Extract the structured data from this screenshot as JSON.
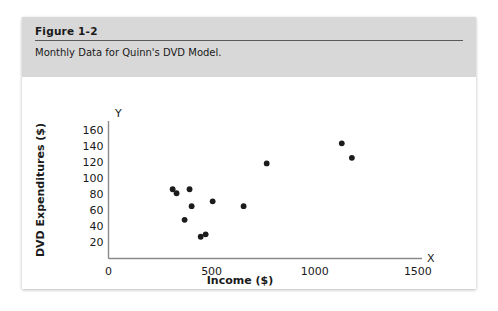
{
  "figure": {
    "number_label": "Figure 1-2",
    "caption": "Monthly Data for Quinn's DVD Model."
  },
  "colors": {
    "header_band": "#d8d8d8",
    "rule": "#5a5a5a",
    "axis": "#8a8a8a",
    "point": "#1c1c1c",
    "text": "#1a1a1a",
    "card_background": "#ffffff",
    "page_background": "#ffffff"
  },
  "chart_data": {
    "type": "scatter",
    "title": "Monthly Data for Quinn's DVD Model.",
    "xlabel": "Income ($)",
    "ylabel": "DVD Expenditures ($)",
    "x_axis_letter": "X",
    "y_axis_letter": "Y",
    "xlim": [
      0,
      1600
    ],
    "ylim": [
      0,
      172
    ],
    "xticks": [
      0,
      500,
      1000,
      1500
    ],
    "xticklabels": [
      "0",
      "500",
      "1000",
      "1500"
    ],
    "yticks": [
      20,
      40,
      60,
      80,
      100,
      120,
      140,
      160
    ],
    "yticklabels": [
      "20",
      "40",
      "60",
      "80",
      "100",
      "120",
      "140",
      "160"
    ],
    "grid": false,
    "legend": false,
    "marker": "filled-circle",
    "x": [
      311,
      330,
      393,
      369,
      403,
      447,
      471,
      505,
      655,
      767,
      1131,
      1180
    ],
    "y": [
      86,
      81,
      86,
      48,
      65,
      27,
      30,
      71,
      65,
      118,
      143,
      125
    ],
    "points": [
      {
        "x": 311,
        "y": 86
      },
      {
        "x": 330,
        "y": 81
      },
      {
        "x": 393,
        "y": 86
      },
      {
        "x": 369,
        "y": 48
      },
      {
        "x": 403,
        "y": 65
      },
      {
        "x": 447,
        "y": 27
      },
      {
        "x": 471,
        "y": 30
      },
      {
        "x": 505,
        "y": 71
      },
      {
        "x": 655,
        "y": 65
      },
      {
        "x": 767,
        "y": 118
      },
      {
        "x": 1131,
        "y": 143
      },
      {
        "x": 1180,
        "y": 125
      }
    ]
  }
}
